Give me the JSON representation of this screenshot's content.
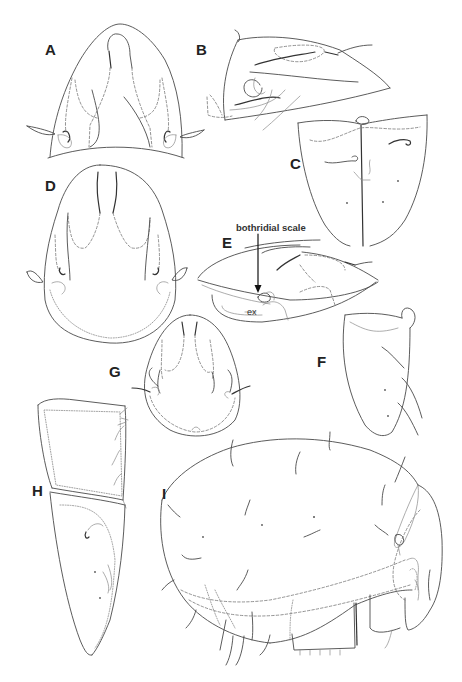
{
  "figure": {
    "type": "scientific line drawing plate",
    "background": "#ffffff",
    "line_color": "#4a4a4a",
    "panels": [
      {
        "id": "A",
        "label": "A",
        "view": "prodorsum, dorsal"
      },
      {
        "id": "B",
        "label": "B",
        "view": "prodorsum, lateral"
      },
      {
        "id": "C",
        "label": "C",
        "view": "plate, ventral"
      },
      {
        "id": "D",
        "label": "D",
        "view": "prodorsum, dorsal"
      },
      {
        "id": "E",
        "label": "E",
        "view": "prodorsum, lateral"
      },
      {
        "id": "F",
        "label": "F",
        "view": "plate"
      },
      {
        "id": "G",
        "label": "G",
        "view": "prodorsum, dorsal"
      },
      {
        "id": "H",
        "label": "H",
        "view": "plates"
      },
      {
        "id": "I",
        "label": "I",
        "view": "body, lateral"
      }
    ],
    "annotations": {
      "bothridial_scale": "bothridial scale",
      "ex": "ex"
    }
  }
}
